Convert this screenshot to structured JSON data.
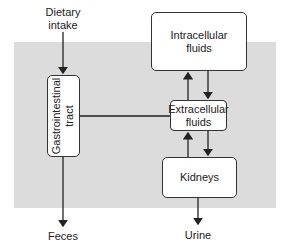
{
  "diagram": {
    "labels": {
      "dietary_intake_line1": "Dietary",
      "dietary_intake_line2": "intake",
      "feces": "Feces",
      "urine": "Urine"
    },
    "nodes": {
      "gi_tract_line1": "Gastrointestinal",
      "gi_tract_line2": "tract",
      "intracellular_line1": "Intracellular",
      "intracellular_line2": "fluids",
      "extracellular_line1": "Extracellular",
      "extracellular_line2": "fluids",
      "kidneys": "Kidneys"
    },
    "edges": [
      {
        "from": "Dietary intake",
        "to": "Gastrointestinal tract"
      },
      {
        "from": "Gastrointestinal tract",
        "to": "Feces"
      },
      {
        "from": "Gastrointestinal tract",
        "to": "Extracellular fluids"
      },
      {
        "from": "Extracellular fluids",
        "to": "Intracellular fluids"
      },
      {
        "from": "Intracellular fluids",
        "to": "Extracellular fluids"
      },
      {
        "from": "Extracellular fluids",
        "to": "Kidneys"
      },
      {
        "from": "Kidneys",
        "to": "Extracellular fluids"
      },
      {
        "from": "Kidneys",
        "to": "Urine"
      }
    ],
    "colors": {
      "background_panel": "#dcdcdc",
      "box_fill": "#ffffff",
      "stroke": "#222222"
    }
  }
}
